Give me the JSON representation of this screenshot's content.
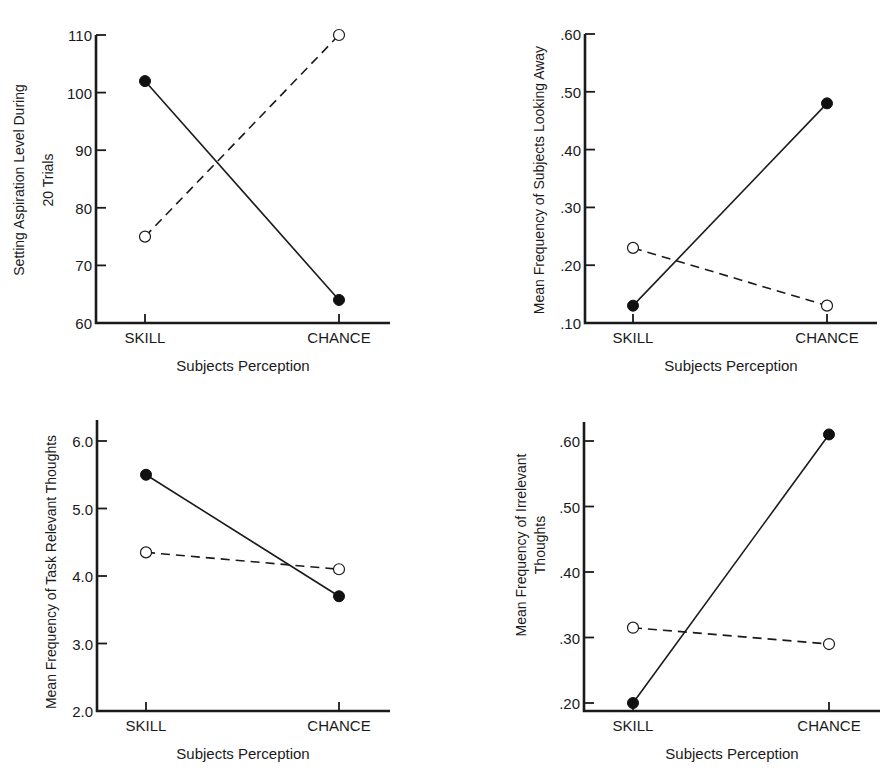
{
  "figure": {
    "panels": [
      {
        "id": "aspiration",
        "ylabel_lines": [
          "Setting  Aspiration Level During",
          "20 Trials"
        ],
        "xlabel": "Subjects Perception",
        "categories": [
          "SKILL",
          "CHANCE"
        ],
        "yticks": [
          "60",
          "70",
          "80",
          "90",
          "100",
          "110"
        ]
      },
      {
        "id": "looking_away",
        "ylabel_lines": [
          "Mean Frequency of Subjects Looking Away"
        ],
        "xlabel": "Subjects Perception",
        "categories": [
          "SKILL",
          "CHANCE"
        ],
        "yticks": [
          ".10",
          ".20",
          ".30",
          ".40",
          ".50",
          ".60"
        ]
      },
      {
        "id": "task_relevant",
        "ylabel_lines": [
          "Mean Frequency of Task Relevant Thoughts"
        ],
        "xlabel": "Subjects Perception",
        "categories": [
          "SKILL",
          "CHANCE"
        ],
        "yticks": [
          "2.0",
          "3.0",
          "4.0",
          "5.0",
          "6.0"
        ]
      },
      {
        "id": "irrelevant",
        "ylabel_lines": [
          "Mean Frequency of  Irrelevant",
          "Thoughts"
        ],
        "xlabel": "Subjects Perception",
        "categories": [
          "SKILL",
          "CHANCE"
        ],
        "yticks": [
          ".20",
          ".30",
          ".40",
          ".50",
          ".60"
        ]
      }
    ]
  },
  "chart_data": [
    {
      "type": "line",
      "title": "",
      "xlabel": "Subjects Perception",
      "ylabel": "Setting Aspiration Level During 20 Trials",
      "categories": [
        "SKILL",
        "CHANCE"
      ],
      "ylim": [
        60,
        110
      ],
      "yticks": [
        60,
        70,
        80,
        90,
        100,
        110
      ],
      "grid": false,
      "legend": null,
      "series": [
        {
          "name": "solid line (filled markers)",
          "style": "solid",
          "marker": "filled-circle",
          "values": [
            102,
            64
          ]
        },
        {
          "name": "dashed line (open markers)",
          "style": "dashed",
          "marker": "open-circle",
          "values": [
            75,
            110
          ]
        }
      ]
    },
    {
      "type": "line",
      "title": "",
      "xlabel": "Subjects Perception",
      "ylabel": "Mean Frequency of Subjects Looking Away",
      "categories": [
        "SKILL",
        "CHANCE"
      ],
      "ylim": [
        0.1,
        0.6
      ],
      "yticks": [
        0.1,
        0.2,
        0.3,
        0.4,
        0.5,
        0.6
      ],
      "grid": false,
      "legend": null,
      "series": [
        {
          "name": "solid line (filled markers)",
          "style": "solid",
          "marker": "filled-circle",
          "values": [
            0.13,
            0.48
          ]
        },
        {
          "name": "dashed line (open markers)",
          "style": "dashed",
          "marker": "open-circle",
          "values": [
            0.23,
            0.13
          ]
        }
      ]
    },
    {
      "type": "line",
      "title": "",
      "xlabel": "Subjects Perception",
      "ylabel": "Mean Frequency of Task Relevant Thoughts",
      "categories": [
        "SKILL",
        "CHANCE"
      ],
      "ylim": [
        2.0,
        6.3
      ],
      "yticks": [
        2.0,
        3.0,
        4.0,
        5.0,
        6.0
      ],
      "grid": false,
      "legend": null,
      "series": [
        {
          "name": "solid line (filled markers)",
          "style": "solid",
          "marker": "filled-circle",
          "values": [
            5.5,
            3.7
          ]
        },
        {
          "name": "dashed line (open markers)",
          "style": "dashed",
          "marker": "open-circle",
          "values": [
            4.35,
            4.1
          ]
        }
      ]
    },
    {
      "type": "line",
      "title": "",
      "xlabel": "Subjects Perception",
      "ylabel": "Mean Frequency of Irrelevant Thoughts",
      "categories": [
        "SKILL",
        "CHANCE"
      ],
      "ylim": [
        0.19,
        0.63
      ],
      "yticks": [
        0.2,
        0.3,
        0.4,
        0.5,
        0.6
      ],
      "grid": false,
      "legend": null,
      "series": [
        {
          "name": "solid line (filled markers)",
          "style": "solid",
          "marker": "filled-circle",
          "values": [
            0.2,
            0.61
          ]
        },
        {
          "name": "dashed line (open markers)",
          "style": "dashed",
          "marker": "open-circle",
          "values": [
            0.315,
            0.29
          ]
        }
      ]
    }
  ]
}
